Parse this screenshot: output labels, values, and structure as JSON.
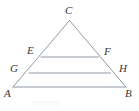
{
  "figure": {
    "kind": "geometry-diagram",
    "background_color": "#ffffff",
    "line_color": "#8e9aa6",
    "label_color": "#33383d",
    "label_style": "italic-serif",
    "labels": {
      "apex": "C",
      "upper_left": "E",
      "upper_right": "F",
      "lower_left": "G",
      "lower_right": "H",
      "base_left": "A",
      "base_right": "B"
    },
    "points": {
      "C": {
        "x": 69.5,
        "y": 20.5
      },
      "E": {
        "x": 41.0,
        "y": 57.0
      },
      "F": {
        "x": 98.5,
        "y": 57.0
      },
      "G": {
        "x": 29.0,
        "y": 73.0
      },
      "H": {
        "x": 110.5,
        "y": 73.0
      },
      "A": {
        "x": 13.0,
        "y": 87.0
      },
      "B": {
        "x": 126.0,
        "y": 87.0
      }
    },
    "label_positions": {
      "C": {
        "x": 65,
        "y": 5
      },
      "E": {
        "x": 27,
        "y": 45
      },
      "F": {
        "x": 104,
        "y": 46
      },
      "G": {
        "x": 10,
        "y": 63
      },
      "H": {
        "x": 119,
        "y": 63
      },
      "A": {
        "x": 4,
        "y": 88
      },
      "B": {
        "x": 125,
        "y": 88
      }
    },
    "segments": [
      {
        "name": "left-side-AC",
        "from": "A",
        "to": "C"
      },
      {
        "name": "right-side-BC",
        "from": "B",
        "to": "C"
      },
      {
        "name": "base-AB",
        "from": "A",
        "to": "B"
      },
      {
        "name": "midline-GH",
        "from": "G",
        "to": "H"
      },
      {
        "name": "upper-midline-EF",
        "from": "E",
        "to": "F"
      }
    ]
  }
}
